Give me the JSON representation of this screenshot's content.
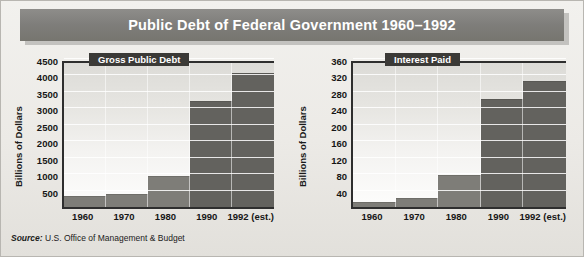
{
  "figure": {
    "title": "Public Debt of Federal Government 1960–1992",
    "source_label": "Source:",
    "source_text": " U.S. Office of Management & Budget",
    "banner_color": "#7e7d7a",
    "bar_color": "#7e7d78",
    "bar_color_dark": "#63625e"
  },
  "chart_data": [
    {
      "type": "bar",
      "title": "Gross Public Debt",
      "xlabel": "",
      "ylabel": "Billions of Dollars",
      "categories": [
        "1960",
        "1970",
        "1980",
        "1990",
        "1992 (est.)"
      ],
      "values": [
        290,
        380,
        910,
        3200,
        4050
      ],
      "ylim": [
        0,
        4500
      ],
      "yticks": [
        500,
        1000,
        1500,
        2000,
        2500,
        3000,
        3500,
        4000,
        4500
      ],
      "grid": true,
      "legend": "none"
    },
    {
      "type": "bar",
      "title": "Interest Paid",
      "xlabel": "",
      "ylabel": "Billions of Dollars",
      "categories": [
        "1960",
        "1970",
        "1980",
        "1990",
        "1992 (est.)"
      ],
      "values": [
        9,
        19,
        75,
        260,
        305
      ],
      "ylim": [
        0,
        360
      ],
      "yticks": [
        40,
        80,
        120,
        160,
        200,
        240,
        280,
        320,
        360
      ],
      "grid": true,
      "legend": "none"
    }
  ]
}
